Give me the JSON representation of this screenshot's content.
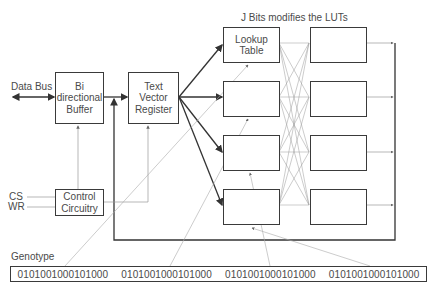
{
  "diagram": {
    "title_note": "J Bits modifies the LUTs",
    "data_bus_label": "Data Bus",
    "buffer": {
      "line1": "Bi",
      "line2": "directional",
      "line3": "Buffer"
    },
    "register": {
      "line1": "Text",
      "line2": "Vector",
      "line3": "Register"
    },
    "lut_first": {
      "line1": "Lookup",
      "line2": "Table"
    },
    "control": {
      "line1": "Control",
      "line2": "Circuitry"
    },
    "signals": {
      "cs": "CS",
      "wr": "WR"
    },
    "genotype": {
      "label": "Genotype",
      "segments": [
        "0101001000101000",
        "0101001000101000",
        "0101001000101000",
        "0101001000101000"
      ]
    },
    "lut_count": 4,
    "output_box_count": 4
  }
}
